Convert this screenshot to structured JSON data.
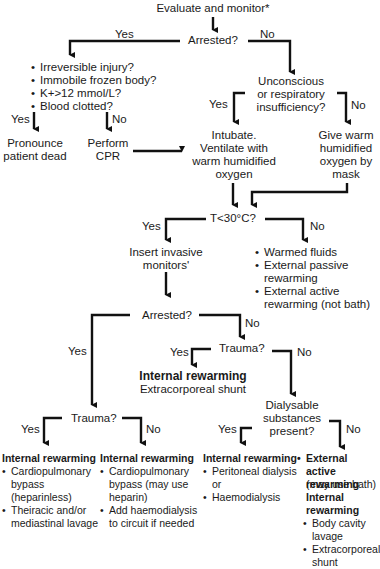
{
  "title": "Evaluate and monitor*",
  "q_arrested_1": "Arrested?",
  "yes": "Yes",
  "no": "No",
  "criteria": [
    "Irreversible injury?",
    "Immobile frozen body?",
    "K+>12 mmol/L?",
    "Blood clotted?"
  ],
  "pronounce_dead": "Pronounce\npatient dead",
  "perform_cpr": "Perform\nCPR",
  "q_unconscious": "Unconscious\nor respiratory\ninsufficiency?",
  "intubate": "Intubate.\nVentilate with\nwarm humidified\noxygen",
  "give_oxygen": "Give warm\nhumidified\noxygen by\nmask",
  "q_temp": "T<30°C?",
  "insert_monitors": "Insert invasive\nmonitors'",
  "warm_measures": [
    "Warmed fluids",
    "External passive\nrewarming",
    "External active\nrewarming (not bath)"
  ],
  "q_arrested_2": "Arrested?",
  "q_trauma_1": "Trauma?",
  "internal_rewarming_shunt": {
    "heading": "Internal rewarming",
    "text": "Extracorporeal shunt"
  },
  "q_dialysable": "Dialysable\nsubstances\npresent?",
  "q_trauma_2": "Trauma?",
  "outcome_trauma_yes": {
    "heading": "Internal rewarming",
    "items": [
      "Cardiopulmonary\nbypass\n(heparinless)",
      "Theiracic and/or\nmediastinal lavage"
    ]
  },
  "outcome_trauma_no": {
    "heading": "Internal rewarming",
    "items": [
      "Cardiopulmonary\nbypass (may use\nheparin)",
      "Add haemodialysis\nto circuit if needed"
    ]
  },
  "outcome_dialysable_yes": {
    "heading": "Internal rewarming",
    "items": [
      "Peritoneal dialysis\nor",
      "Haemodialysis"
    ]
  },
  "outcome_dialysable_no": {
    "external_heading": "External active\nrewarming",
    "external_note": "(may use bath)",
    "internal_heading": "Internal\nrewarming",
    "items": [
      "Body cavity\nlavage",
      "Extracorporeal\nshunt"
    ]
  }
}
